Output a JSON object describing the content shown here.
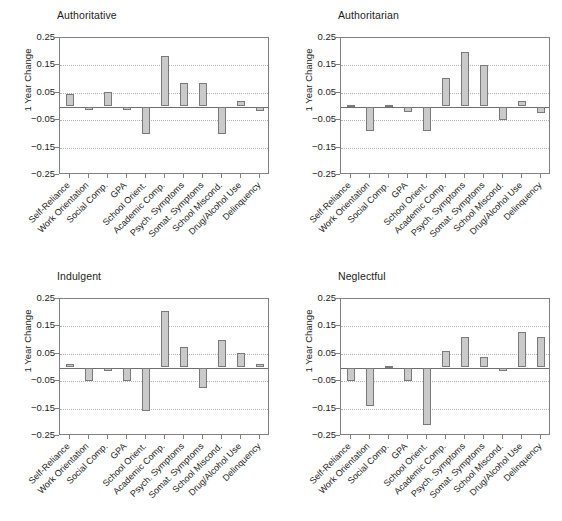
{
  "figure": {
    "ylabel": "1 Year Change",
    "yticks": [
      0.25,
      0.15,
      0.05,
      -0.05,
      -0.15,
      -0.25
    ],
    "ytick_labels": [
      "0.25",
      "0.15",
      "0.05",
      "−0.05",
      "−0.15",
      "−0.25"
    ],
    "bar_fill": "#cacaca",
    "bar_edge": "#7a7a7a",
    "grid_color": "#b4b4b4",
    "axis_color": "#808080",
    "zero_line_color": "#6e6e6e"
  },
  "chart_data": {
    "type": "bar",
    "title": "",
    "xlabel": "",
    "ylabel": "1 Year Change",
    "ylim": [
      -0.25,
      0.25
    ],
    "grid": true,
    "legend": "none",
    "ytick_values": [
      0.25,
      0.15,
      0.05,
      -0.05,
      -0.15,
      -0.25
    ],
    "categories": [
      "Self-Reliance",
      "Work Orientation",
      "Social Comp.",
      "GPA",
      "School Orient.",
      "Academic Comp.",
      "Psych. Symptoms",
      "Somat. Symptoms",
      "School Miscond.",
      "Drug/Alcohol Use",
      "Delinquency"
    ],
    "panels": [
      {
        "title": "Authoritative",
        "values": [
          0.045,
          -0.012,
          0.052,
          -0.012,
          -0.1,
          0.185,
          0.085,
          0.085,
          -0.1,
          0.02,
          -0.015
        ]
      },
      {
        "title": "Authoritarian",
        "values": [
          0.0,
          -0.088,
          0.0,
          -0.02,
          -0.088,
          0.105,
          0.2,
          0.15,
          -0.05,
          0.02,
          -0.025
        ]
      },
      {
        "title": "Indulgent",
        "values": [
          0.012,
          -0.05,
          -0.012,
          -0.05,
          -0.158,
          0.205,
          0.075,
          -0.075,
          0.1,
          0.052,
          0.012
        ]
      },
      {
        "title": "Neglectful",
        "values": [
          -0.05,
          -0.14,
          0.0,
          -0.05,
          -0.21,
          0.06,
          0.11,
          0.04,
          -0.012,
          0.13,
          0.11
        ]
      }
    ]
  }
}
